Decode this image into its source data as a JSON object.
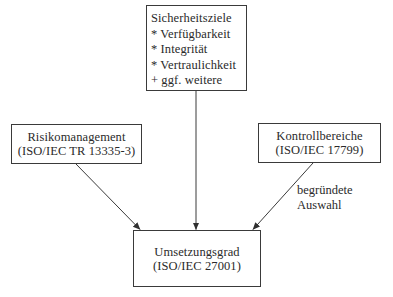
{
  "diagram": {
    "type": "flow",
    "colors": {
      "stroke": "#3a3a3a",
      "text": "#2a2a2a",
      "background": "#ffffff"
    },
    "nodes": {
      "goals": {
        "title": "Sicherheitsziele",
        "items": [
          "* Verfügbarkeit",
          "* Integrität",
          "* Vertraulichkeit",
          "+ ggf. weitere"
        ]
      },
      "risk": {
        "line1": "Risikomanagement",
        "line2": "(ISO/IEC TR 13335-3)"
      },
      "control": {
        "line1": "Kontrollbereiche",
        "line2": "(ISO/IEC 17799)"
      },
      "result": {
        "line1": "Umsetzungsgrad",
        "line2": "(ISO/IEC 27001)"
      }
    },
    "edges": [
      {
        "from": "risk",
        "to": "result",
        "label": ""
      },
      {
        "from": "goals",
        "to": "result",
        "label": ""
      },
      {
        "from": "control",
        "to": "result",
        "label": "begründete Auswahl"
      }
    ],
    "edge_label": {
      "line1": "begründete",
      "line2": "Auswahl"
    }
  }
}
